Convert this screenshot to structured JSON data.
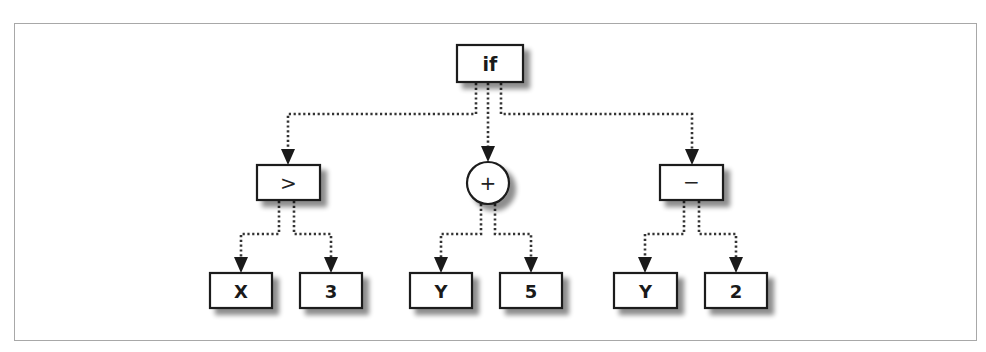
{
  "diagram": {
    "type": "expression-tree",
    "root": {
      "id": "if",
      "label": "if",
      "shape": "box",
      "children": [
        {
          "id": "gt",
          "label": ">",
          "shape": "box",
          "children": [
            {
              "id": "x",
              "label": "X",
              "shape": "box"
            },
            {
              "id": "three",
              "label": "3",
              "shape": "box"
            }
          ]
        },
        {
          "id": "plus",
          "label": "+",
          "shape": "circle",
          "children": [
            {
              "id": "y1",
              "label": "Y",
              "shape": "box"
            },
            {
              "id": "five",
              "label": "5",
              "shape": "box"
            }
          ]
        },
        {
          "id": "minus",
          "label": "−",
          "shape": "box",
          "children": [
            {
              "id": "y2",
              "label": "Y",
              "shape": "box"
            },
            {
              "id": "two",
              "label": "2",
              "shape": "box"
            }
          ]
        }
      ]
    },
    "nodes": {
      "if": "if",
      "gt": ">",
      "plus": "+",
      "minus": "−",
      "x": "X",
      "three": "3",
      "y1": "Y",
      "five": "5",
      "y2": "Y",
      "two": "2"
    },
    "edges": [
      [
        "if",
        "gt"
      ],
      [
        "if",
        "plus"
      ],
      [
        "if",
        "minus"
      ],
      [
        "gt",
        "x"
      ],
      [
        "gt",
        "three"
      ],
      [
        "plus",
        "y1"
      ],
      [
        "plus",
        "five"
      ],
      [
        "minus",
        "y2"
      ],
      [
        "minus",
        "two"
      ]
    ],
    "colors": {
      "stroke": "#1a1a1a",
      "frame": "#a8a8a8",
      "shadow": "#9a9a9a"
    }
  }
}
